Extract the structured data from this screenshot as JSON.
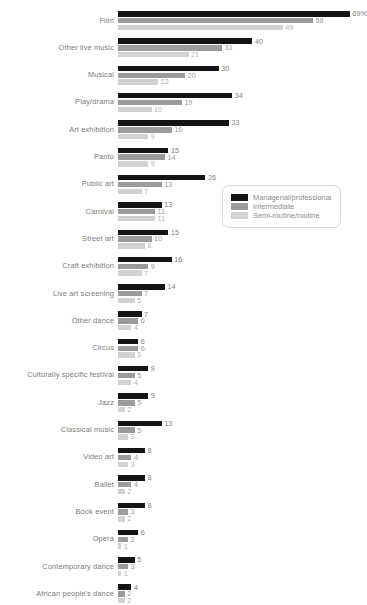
{
  "chart_data": {
    "type": "bar",
    "orientation": "horizontal",
    "title": "",
    "subtitle": "",
    "xlabel": "",
    "ylabel": "",
    "xlim": [
      0,
      69
    ],
    "grid": false,
    "legend_position": "middle-right",
    "value_suffix_first": "%",
    "categories": [
      "Film",
      "Other live music",
      "Musical",
      "Play/drama",
      "Art exhibition",
      "Panto",
      "Public art",
      "Carnival",
      "Street art",
      "Craft exhibition",
      "Live art screening",
      "Other dance",
      "Circus",
      "Culturally specific festival",
      "Jazz",
      "Classical music",
      "Video art",
      "Ballet",
      "Book event",
      "Opera",
      "Contemporary dance",
      "African people's dance"
    ],
    "series": [
      {
        "name": "Managerial/professional",
        "color": "#141414",
        "values": [
          69,
          40,
          30,
          34,
          33,
          15,
          26,
          13,
          15,
          16,
          14,
          7,
          6,
          9,
          9,
          13,
          8,
          8,
          8,
          6,
          5,
          4
        ],
        "labels": [
          "69%",
          "40",
          "30",
          "34",
          "33",
          "15",
          "26",
          "13",
          "15",
          "16",
          "14",
          "7",
          "6",
          "9",
          "9",
          "13",
          "8",
          "8",
          "8",
          "6",
          "5",
          "4"
        ]
      },
      {
        "name": "Intermediate",
        "color": "#9b9b9b",
        "values": [
          58,
          31,
          20,
          19,
          16,
          14,
          13,
          11,
          10,
          9,
          7,
          6,
          6,
          5,
          5,
          5,
          4,
          4,
          3,
          3,
          3,
          2
        ],
        "labels": [
          "58",
          "31",
          "20",
          "19",
          "16",
          "14",
          "13",
          "11",
          "10",
          "9",
          "7",
          "6",
          "6",
          "5",
          "5",
          "5",
          "4",
          "4",
          "3",
          "3",
          "3",
          "2"
        ]
      },
      {
        "name": "Semi-routine/routine",
        "color": "#d2d2d2",
        "values": [
          49,
          21,
          12,
          10,
          9,
          9,
          7,
          11,
          8,
          7,
          5,
          4,
          5,
          4,
          2,
          3,
          3,
          2,
          2,
          1,
          1,
          2
        ],
        "labels": [
          "49",
          "21",
          "12",
          "10",
          "9",
          "9",
          "7",
          "11",
          "8",
          "7",
          "5",
          "4",
          "5",
          "4",
          "2",
          "3",
          "3",
          "2",
          "2",
          "1",
          "1",
          "2"
        ]
      }
    ]
  },
  "legend": {
    "items": [
      {
        "label": "Managerial/professional",
        "color": "#141414"
      },
      {
        "label": "Intermediate",
        "color": "#9b9b9b"
      },
      {
        "label": "Semi-routine/routine",
        "color": "#d2d2d2"
      }
    ]
  }
}
